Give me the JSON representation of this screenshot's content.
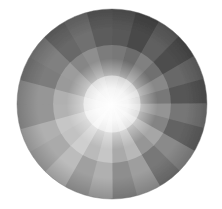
{
  "figure": {
    "background_color": "#ffffff",
    "canvas": {
      "width": 222,
      "height": 209
    }
  },
  "chart_data": {
    "type": "pie",
    "subtitle": "",
    "xlabel": "",
    "ylabel": "",
    "grid": false,
    "legend_position": "none",
    "center_x": 112,
    "center_y": 104,
    "radius": 95,
    "wedge_count": 24,
    "wedge_angle_deg": 15,
    "start_angle_deg": -90,
    "center_highlight_color": "#ffffff",
    "center_highlight_radius": 12,
    "edge_color": "#6b6b6b",
    "categories": [
      "w01",
      "w02",
      "w03",
      "w04",
      "w05",
      "w06",
      "w07",
      "w08",
      "w09",
      "w10",
      "w11",
      "w12",
      "w13",
      "w14",
      "w15",
      "w16",
      "w17",
      "w18",
      "w19",
      "w20",
      "w21",
      "w22",
      "w23",
      "w24"
    ],
    "values": [
      15,
      15,
      15,
      15,
      15,
      15,
      15,
      15,
      15,
      15,
      15,
      15,
      15,
      15,
      15,
      15,
      15,
      15,
      15,
      15,
      15,
      15,
      15,
      15
    ],
    "series": [
      {
        "name": "outer rim luminance",
        "values": [
          88,
          74,
          96,
          78,
          104,
          86,
          118,
          99,
          138,
          120,
          158,
          142,
          176,
          160,
          188,
          170,
          176,
          150,
          150,
          124,
          128,
          104,
          112,
          92
        ]
      },
      {
        "name": "mid radius luminance",
        "values": [
          120,
          108,
          128,
          112,
          136,
          120,
          148,
          132,
          166,
          150,
          184,
          170,
          198,
          186,
          206,
          194,
          198,
          178,
          176,
          154,
          156,
          134,
          142,
          124
        ]
      },
      {
        "name": "inner luminance",
        "values": [
          186,
          178,
          190,
          180,
          196,
          186,
          202,
          192,
          212,
          204,
          222,
          214,
          230,
          222,
          236,
          228,
          230,
          218,
          216,
          204,
          206,
          192,
          198,
          188
        ]
      }
    ],
    "colors_outer": [
      "#585858",
      "#4a4a4a",
      "#606060",
      "#4e4e4e",
      "#686868",
      "#565656",
      "#767676",
      "#636363",
      "#8a8a8a",
      "#787878",
      "#9e9e9e",
      "#8e8e8e",
      "#b0b0b0",
      "#a0a0a0",
      "#bcbcbc",
      "#aaaaaa",
      "#b0b0b0",
      "#969696",
      "#969696",
      "#7c7c7c",
      "#808080",
      "#686868",
      "#707070",
      "#5c5c5c"
    ],
    "colors_mid": [
      "#787878",
      "#6c6c6c",
      "#808080",
      "#707070",
      "#888888",
      "#787878",
      "#949494",
      "#848484",
      "#a6a6a6",
      "#969696",
      "#b8b8b8",
      "#aaaaaa",
      "#c6c6c6",
      "#bababa",
      "#cecece",
      "#c2c2c2",
      "#c6c6c6",
      "#b2b2b2",
      "#b0b0b0",
      "#9a9a9a",
      "#9c9c9c",
      "#868686",
      "#8e8e8e",
      "#7c7c7c"
    ],
    "colors_inner": [
      "#bababa",
      "#b2b2b2",
      "#bebebe",
      "#b4b4b4",
      "#c4c4c4",
      "#bababa",
      "#cacaca",
      "#c0c0c0",
      "#d4d4d4",
      "#cccccc",
      "#dedede",
      "#d6d6d6",
      "#e6e6e6",
      "#dedede",
      "#ececec",
      "#e4e4e4",
      "#e6e6e6",
      "#dadada",
      "#d8d8d8",
      "#cccccc",
      "#cecece",
      "#c0c0c0",
      "#c6c6c6",
      "#bcbcbc"
    ],
    "annotations": []
  }
}
